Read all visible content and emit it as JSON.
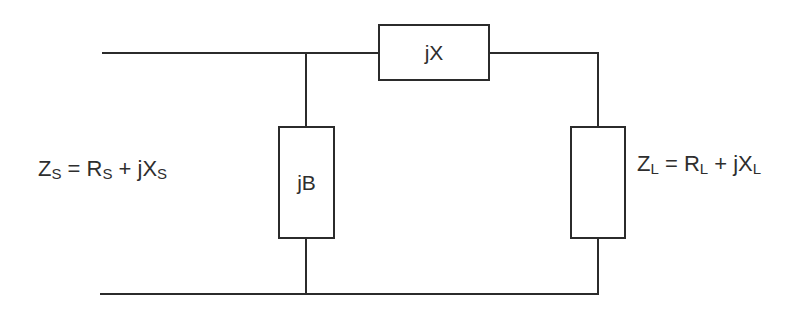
{
  "diagram": {
    "type": "circuit",
    "components": {
      "series": {
        "label": "jX"
      },
      "shunt": {
        "label": "jB"
      },
      "load_box": {
        "label": ""
      }
    },
    "source_label": {
      "Z": "Z",
      "Z_sub": "S",
      "eq": " = ",
      "R": "R",
      "R_sub": "S",
      "plus": " + jX",
      "X_sub": "S"
    },
    "load_label": {
      "Z": "Z",
      "Z_sub": "L",
      "eq": " = ",
      "R": "R",
      "R_sub": "L",
      "plus": " + jX",
      "X_sub": "L"
    },
    "colors": {
      "line": "#2b2b2b",
      "text": "#2e2e2e",
      "background": "#ffffff"
    }
  }
}
